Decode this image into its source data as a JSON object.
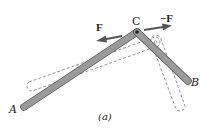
{
  "figure": {
    "caption": "(a)",
    "labels": {
      "point_a": "A",
      "point_b": "B",
      "point_c": "C",
      "force_left": "F",
      "force_right": "−F"
    },
    "colors": {
      "bar_fill": "#9a9a9a",
      "bar_edge": "#555555",
      "dashed_outline": "#777777",
      "arrow": "#555555",
      "text": "#222222"
    },
    "geometry": {
      "point_a": [
        23,
        108
      ],
      "point_c": [
        137,
        32
      ],
      "point_b": [
        189,
        82
      ]
    }
  }
}
